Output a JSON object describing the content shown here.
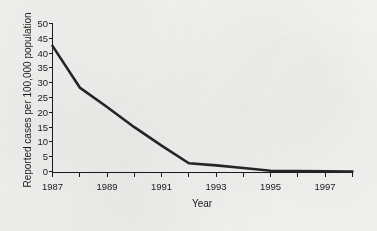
{
  "figure": {
    "background_color": "#f2f2f0",
    "ink_color": "#1b1b1b",
    "line_color": "#262626"
  },
  "chart_data": {
    "type": "line",
    "title": "",
    "subtitle": "",
    "xlabel": "Year",
    "ylabel": "Reported cases per 100,000 population",
    "xlim": [
      1987,
      1998
    ],
    "ylim": [
      0,
      50
    ],
    "grid": false,
    "legend": null,
    "legend_position": "none",
    "x_tick_labels": [
      "1987",
      "1989",
      "1991",
      "1993",
      "1995",
      "1997"
    ],
    "x_tick_values": [
      1987,
      1989,
      1991,
      1993,
      1995,
      1997
    ],
    "x_minor_tick_values": [
      1988,
      1990,
      1992,
      1994,
      1996,
      1998
    ],
    "y_tick_labels": [
      "0",
      "5",
      "10",
      "15",
      "20",
      "25",
      "30",
      "35",
      "40",
      "45",
      "50"
    ],
    "y_tick_values": [
      0,
      5,
      10,
      15,
      20,
      25,
      30,
      35,
      40,
      45,
      50
    ],
    "x": [
      1987,
      1988,
      1989,
      1990,
      1991,
      1992,
      1993,
      1994,
      1995,
      1996,
      1997,
      1998
    ],
    "values": [
      42.5,
      28.5,
      22.0,
      15.2,
      9.0,
      3.1,
      2.4,
      1.5,
      0.6,
      0.45,
      0.4,
      0.3
    ],
    "series": [
      {
        "name": "Reported cases per 100,000 population",
        "values": [
          42.5,
          28.5,
          22.0,
          15.2,
          9.0,
          3.1,
          2.4,
          1.5,
          0.6,
          0.45,
          0.4,
          0.3
        ]
      }
    ],
    "annotations": []
  },
  "axes_labels": {
    "x_title": "Year",
    "y_title": "Reported cases per 100,000 population"
  }
}
